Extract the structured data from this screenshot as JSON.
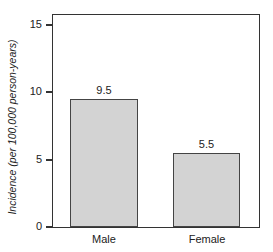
{
  "chart_data": {
    "type": "bar",
    "title": "",
    "xlabel": "",
    "ylabel": "Incidence (per 100,000 person-years)",
    "categories": [
      "Male",
      "Female"
    ],
    "values": [
      9.5,
      5.5
    ],
    "data_labels": [
      "9.5",
      "5.5"
    ],
    "ylim": [
      0,
      15.7
    ],
    "yticks": [
      0,
      5,
      10,
      15
    ],
    "ytick_labels": [
      "0",
      "5",
      "10",
      "15"
    ],
    "grid": false,
    "legend": null,
    "bar_color": "#d3d3d3",
    "bar_edge_color": "#444444"
  }
}
